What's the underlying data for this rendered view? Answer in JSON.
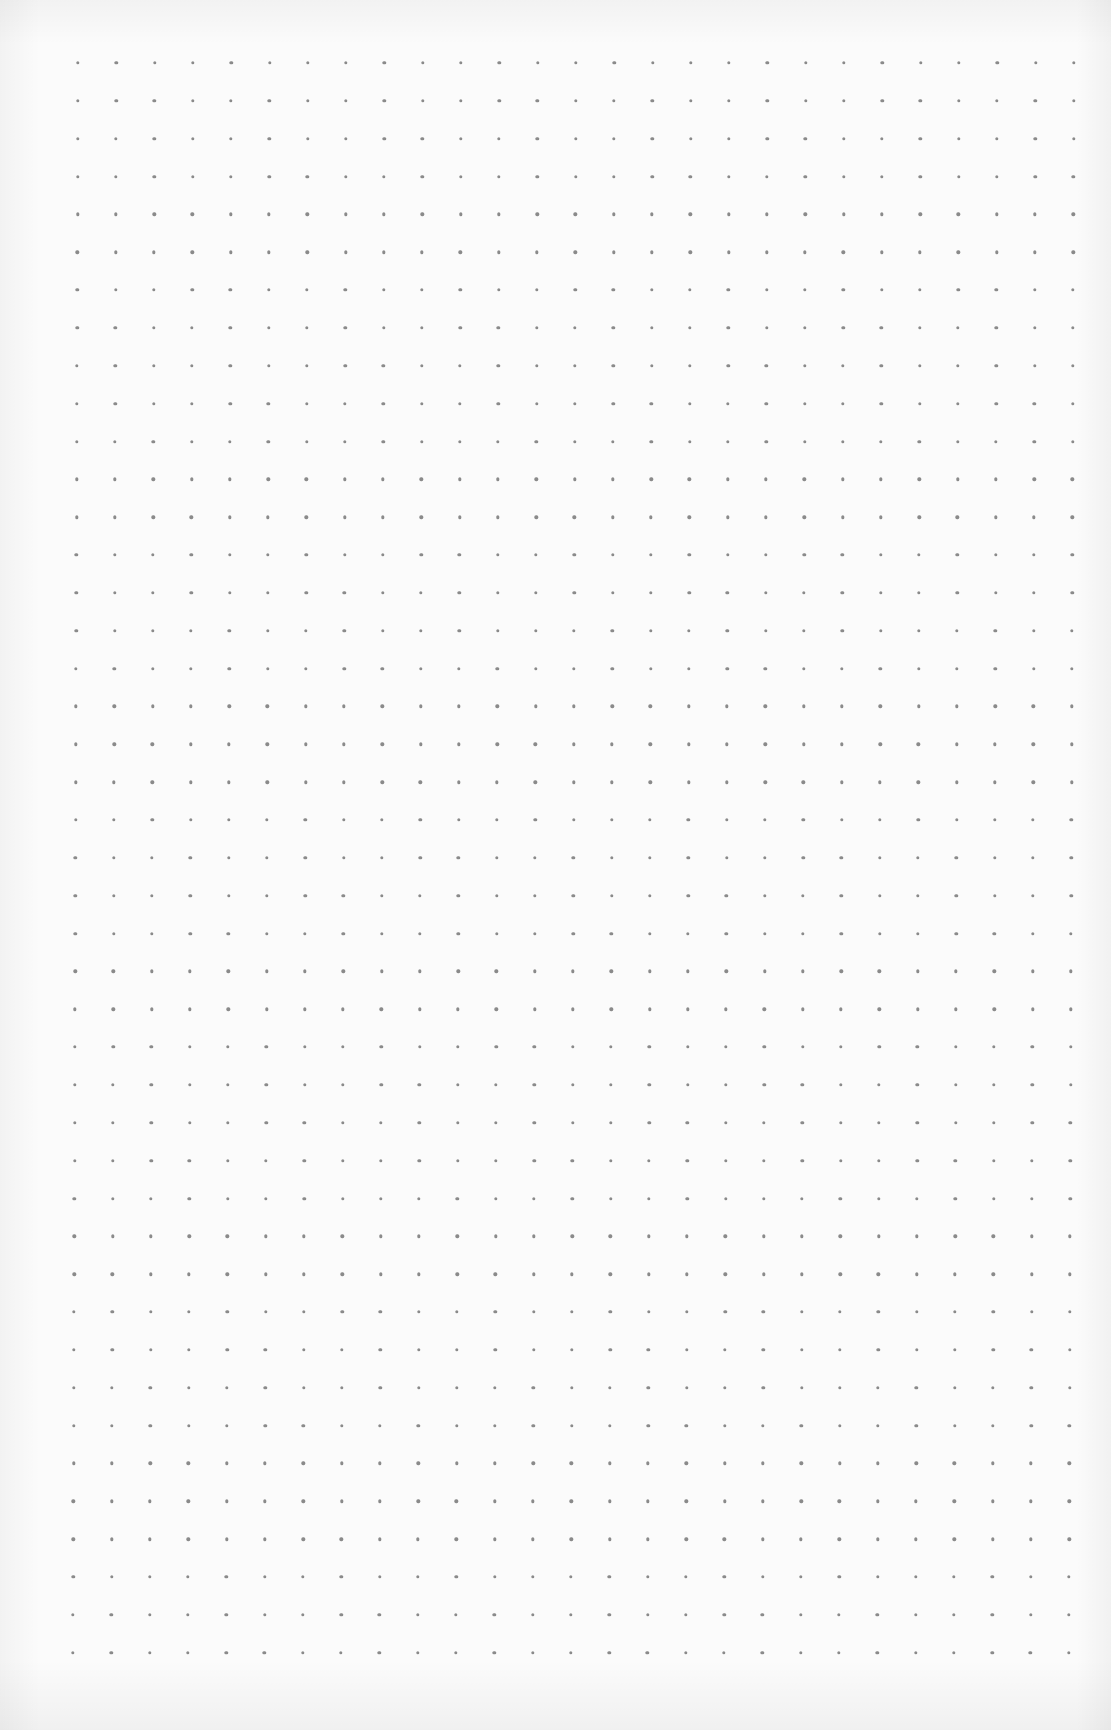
{
  "page": {
    "type": "dot-grid-paper",
    "background_color": "#fbfbfb",
    "dot_color": "#8a8a8a"
  },
  "grid": {
    "columns": 27,
    "rows": 43,
    "origin_x": 78,
    "origin_y": 63,
    "spacing_x": 38.3,
    "spacing_y": 37.85,
    "dot_diameter": 3.4,
    "skew_x_per_row": -0.12
  }
}
